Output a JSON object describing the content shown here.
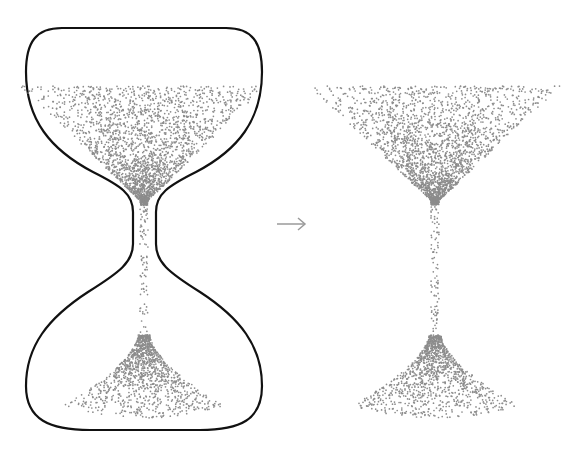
{
  "diagram": {
    "left_panel": {
      "label": "hourglass with sand",
      "outline_color": "#111111",
      "outline_width": 2.2
    },
    "arrow": {
      "glyph": "→",
      "direction": "right",
      "color": "#9a9a9a"
    },
    "right_panel": {
      "label": "sand only"
    },
    "sand": {
      "color": "#8c8c8c",
      "dot_radius": 0.85
    }
  }
}
